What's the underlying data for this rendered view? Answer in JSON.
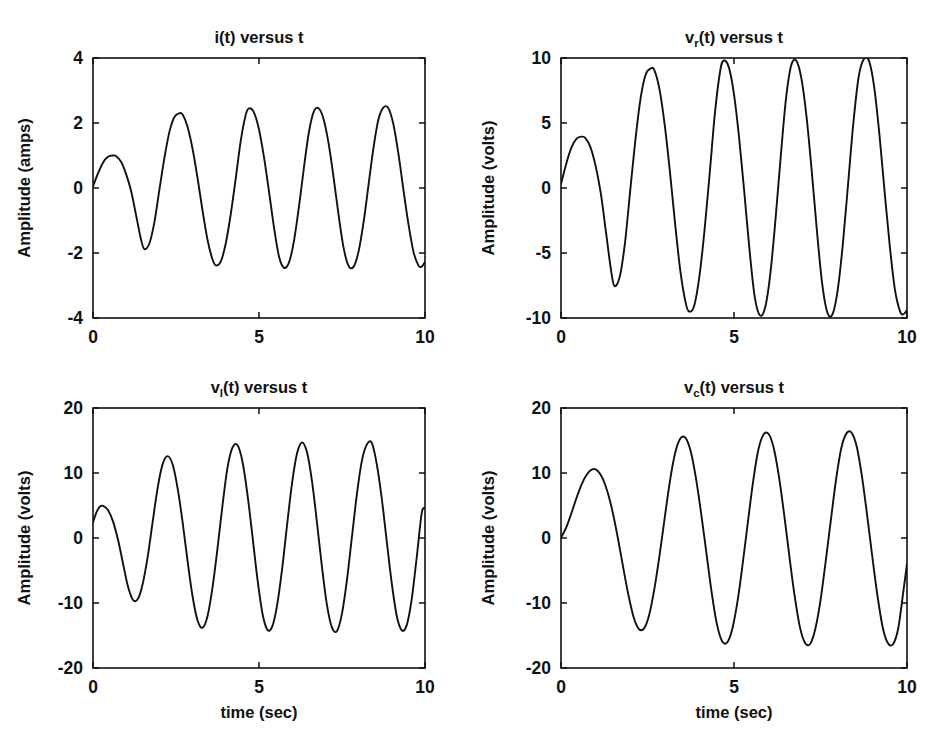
{
  "figure": {
    "background": "#ffffff",
    "line_color": "#111111",
    "width": 937,
    "height": 741,
    "layout": "2x2 subplot grid"
  },
  "chart_data": [
    {
      "id": "current",
      "type": "line",
      "title": "i(t) versus t",
      "title_base": "i",
      "title_sub": "",
      "title_rest": "(t) versus t",
      "xlabel": "",
      "ylabel": "Amplitude (amps)",
      "xlim": [
        0,
        10
      ],
      "ylim": [
        -4,
        4
      ],
      "xticks": [
        0,
        5,
        10
      ],
      "xticklabels": [
        "0",
        "5",
        "10"
      ],
      "yticks": [
        -4,
        -2,
        0,
        2,
        4
      ],
      "yticklabels": [
        "-4",
        "-2",
        "0",
        "2",
        "4"
      ],
      "grid": false,
      "legend": "none",
      "series": [
        {
          "name": "i(t)",
          "x": [
            0.0,
            0.15,
            0.3,
            0.45,
            0.6,
            0.7,
            0.85,
            1.0,
            1.15,
            1.3,
            1.45,
            1.55,
            1.7,
            1.85,
            2.0,
            2.15,
            2.3,
            2.45,
            2.6,
            2.7,
            2.85,
            3.0,
            3.15,
            3.3,
            3.45,
            3.6,
            3.7,
            3.85,
            4.0,
            4.15,
            4.3,
            4.45,
            4.6,
            4.7,
            4.85,
            5.0,
            5.15,
            5.3,
            5.45,
            5.6,
            5.75,
            5.9,
            6.05,
            6.2,
            6.35,
            6.5,
            6.65,
            6.8,
            6.95,
            7.1,
            7.25,
            7.4,
            7.55,
            7.7,
            7.85,
            8.0,
            8.15,
            8.3,
            8.45,
            8.6,
            8.75,
            8.9,
            9.05,
            9.2,
            9.35,
            9.5,
            9.65,
            9.8,
            9.9,
            10.0
          ],
          "y": [
            0.05,
            0.45,
            0.78,
            0.96,
            1.0,
            0.98,
            0.8,
            0.42,
            -0.1,
            -0.85,
            -1.6,
            -1.88,
            -1.7,
            -1.05,
            -0.05,
            0.92,
            1.72,
            2.18,
            2.3,
            2.26,
            1.88,
            1.2,
            0.3,
            -0.7,
            -1.6,
            -2.2,
            -2.38,
            -2.26,
            -1.7,
            -0.8,
            0.3,
            1.45,
            2.25,
            2.45,
            2.32,
            1.8,
            0.95,
            -0.1,
            -1.2,
            -2.1,
            -2.45,
            -2.3,
            -1.65,
            -0.6,
            0.6,
            1.7,
            2.35,
            2.45,
            2.1,
            1.35,
            0.3,
            -0.85,
            -1.85,
            -2.4,
            -2.42,
            -1.95,
            -1.05,
            0.1,
            1.25,
            2.12,
            2.48,
            2.45,
            1.95,
            1.05,
            -0.05,
            -1.1,
            -1.95,
            -2.38,
            -2.42,
            -2.28
          ]
        }
      ]
    },
    {
      "id": "resistor",
      "type": "line",
      "title": "vr(t) versus t",
      "title_base": "v",
      "title_sub": "r",
      "title_rest": "(t) versus t",
      "xlabel": "",
      "ylabel": "Amplitude (volts)",
      "xlim": [
        0,
        10
      ],
      "ylim": [
        -10,
        10
      ],
      "xticks": [
        0,
        5,
        10
      ],
      "xticklabels": [
        "0",
        "5",
        "10"
      ],
      "yticks": [
        -10,
        -5,
        0,
        5,
        10
      ],
      "yticklabels": [
        "-10",
        "-5",
        "0",
        "5",
        "10"
      ],
      "grid": false,
      "legend": "none",
      "series": [
        {
          "name": "vr(t)",
          "x": [
            0.0,
            0.15,
            0.3,
            0.45,
            0.6,
            0.7,
            0.85,
            1.0,
            1.15,
            1.3,
            1.45,
            1.55,
            1.7,
            1.85,
            2.0,
            2.15,
            2.3,
            2.45,
            2.6,
            2.7,
            2.85,
            3.0,
            3.15,
            3.3,
            3.45,
            3.6,
            3.7,
            3.85,
            4.0,
            4.15,
            4.3,
            4.45,
            4.6,
            4.7,
            4.85,
            5.0,
            5.15,
            5.3,
            5.45,
            5.6,
            5.75,
            5.9,
            6.05,
            6.2,
            6.35,
            6.5,
            6.65,
            6.8,
            6.95,
            7.1,
            7.25,
            7.4,
            7.55,
            7.7,
            7.85,
            8.0,
            8.15,
            8.3,
            8.45,
            8.6,
            8.75,
            8.9,
            9.05,
            9.2,
            9.35,
            9.5,
            9.65,
            9.8,
            9.9,
            10.0
          ],
          "y": [
            0.3,
            1.85,
            3.1,
            3.8,
            3.95,
            3.85,
            3.15,
            1.7,
            -0.4,
            -3.4,
            -6.4,
            -7.55,
            -6.8,
            -4.2,
            -0.2,
            3.7,
            6.9,
            8.75,
            9.2,
            9.05,
            7.55,
            4.8,
            1.2,
            -2.8,
            -6.4,
            -8.8,
            -9.5,
            -9.05,
            -6.8,
            -3.2,
            1.2,
            5.8,
            9.0,
            9.8,
            9.3,
            7.2,
            3.8,
            -0.4,
            -4.8,
            -8.4,
            -9.8,
            -9.2,
            -6.6,
            -2.4,
            2.4,
            6.8,
            9.4,
            9.8,
            8.4,
            5.4,
            1.2,
            -3.4,
            -7.4,
            -9.6,
            -9.7,
            -7.8,
            -4.2,
            0.4,
            5.0,
            8.5,
            9.9,
            9.8,
            7.8,
            4.2,
            -0.2,
            -4.4,
            -7.8,
            -9.5,
            -9.7,
            -9.4
          ]
        }
      ]
    },
    {
      "id": "inductor",
      "type": "line",
      "title": "vl(t) versus t",
      "title_base": "v",
      "title_sub": "l",
      "title_rest": "(t) versus t",
      "xlabel": "time (sec)",
      "ylabel": "Amplitude (volts)",
      "xlim": [
        0,
        10
      ],
      "ylim": [
        -20,
        20
      ],
      "xticks": [
        0,
        5,
        10
      ],
      "xticklabels": [
        "0",
        "5",
        "10"
      ],
      "yticks": [
        -20,
        -10,
        0,
        10,
        20
      ],
      "yticklabels": [
        "-20",
        "-10",
        "0",
        "10",
        "20"
      ],
      "grid": false,
      "legend": "none",
      "series": [
        {
          "name": "vl(t)",
          "x": [
            0.0,
            0.1,
            0.2,
            0.3,
            0.45,
            0.6,
            0.75,
            0.9,
            1.05,
            1.2,
            1.35,
            1.5,
            1.65,
            1.8,
            1.95,
            2.1,
            2.25,
            2.4,
            2.55,
            2.7,
            2.85,
            3.0,
            3.15,
            3.3,
            3.45,
            3.6,
            3.75,
            3.9,
            4.05,
            4.2,
            4.35,
            4.5,
            4.65,
            4.8,
            4.95,
            5.1,
            5.25,
            5.4,
            5.55,
            5.7,
            5.85,
            6.0,
            6.15,
            6.3,
            6.45,
            6.6,
            6.75,
            6.9,
            7.05,
            7.2,
            7.35,
            7.5,
            7.65,
            7.8,
            7.95,
            8.1,
            8.25,
            8.4,
            8.55,
            8.7,
            8.85,
            9.0,
            9.15,
            9.3,
            9.45,
            9.6,
            9.75,
            9.9,
            10.0
          ],
          "y": [
            2.4,
            3.9,
            4.8,
            4.95,
            4.3,
            2.6,
            -0.2,
            -3.8,
            -7.4,
            -9.5,
            -9.4,
            -7.0,
            -2.8,
            2.6,
            7.8,
            11.4,
            12.6,
            11.3,
            7.6,
            2.4,
            -3.6,
            -9.0,
            -12.7,
            -13.8,
            -12.0,
            -7.6,
            -1.6,
            5.0,
            10.8,
            13.9,
            14.3,
            11.8,
            6.8,
            0.4,
            -6.2,
            -11.5,
            -14.1,
            -13.6,
            -10.2,
            -4.6,
            2.2,
            8.6,
            13.1,
            14.7,
            13.1,
            8.6,
            2.2,
            -4.6,
            -10.4,
            -13.8,
            -14.3,
            -11.6,
            -6.4,
            0.2,
            6.8,
            11.9,
            14.4,
            14.6,
            11.3,
            6.0,
            -0.6,
            -7.0,
            -12.0,
            -14.2,
            -13.4,
            -9.4,
            -3.0,
            3.8,
            4.6
          ]
        }
      ]
    },
    {
      "id": "capacitor",
      "type": "line",
      "title": "vc(t) versus t",
      "title_base": "v",
      "title_sub": "c",
      "title_rest": "(t) versus t",
      "xlabel": "time (sec)",
      "ylabel": "Amplitude (volts)",
      "xlim": [
        0,
        10
      ],
      "ylim": [
        -20,
        20
      ],
      "xticks": [
        0,
        5,
        10
      ],
      "xticklabels": [
        "0",
        "5",
        "10"
      ],
      "yticks": [
        -20,
        -10,
        0,
        10,
        20
      ],
      "yticklabels": [
        "-20",
        "-10",
        "0",
        "10",
        "20"
      ],
      "grid": false,
      "legend": "none",
      "series": [
        {
          "name": "vc(t)",
          "x": [
            0.0,
            0.15,
            0.3,
            0.45,
            0.6,
            0.75,
            0.9,
            1.05,
            1.2,
            1.35,
            1.5,
            1.65,
            1.8,
            1.95,
            2.1,
            2.25,
            2.4,
            2.55,
            2.7,
            2.85,
            3.0,
            3.15,
            3.3,
            3.45,
            3.6,
            3.75,
            3.9,
            4.05,
            4.2,
            4.35,
            4.5,
            4.65,
            4.8,
            4.95,
            5.1,
            5.25,
            5.4,
            5.55,
            5.7,
            5.85,
            6.0,
            6.15,
            6.3,
            6.45,
            6.6,
            6.75,
            6.9,
            7.05,
            7.2,
            7.35,
            7.5,
            7.65,
            7.8,
            7.95,
            8.1,
            8.25,
            8.4,
            8.55,
            8.7,
            8.85,
            9.0,
            9.15,
            9.3,
            9.45,
            9.6,
            9.75,
            9.9,
            10.0
          ],
          "y": [
            0.05,
            1.6,
            3.8,
            6.2,
            8.3,
            9.8,
            10.55,
            10.4,
            9.2,
            7.0,
            3.8,
            -0.2,
            -4.6,
            -8.8,
            -12.2,
            -14.0,
            -13.9,
            -11.8,
            -7.8,
            -2.6,
            3.2,
            8.8,
            13.1,
            15.3,
            15.4,
            13.3,
            9.2,
            3.8,
            -2.2,
            -8.2,
            -13.1,
            -15.8,
            -16.1,
            -14.0,
            -9.8,
            -4.0,
            2.4,
            8.6,
            13.5,
            15.9,
            16.0,
            13.8,
            9.4,
            3.6,
            -2.8,
            -8.8,
            -13.6,
            -16.1,
            -16.3,
            -14.0,
            -9.6,
            -3.6,
            2.8,
            9.0,
            13.8,
            16.1,
            16.2,
            14.0,
            9.4,
            3.4,
            -3.0,
            -9.0,
            -13.8,
            -16.2,
            -16.3,
            -13.8,
            -8.0,
            -4.0
          ]
        }
      ]
    }
  ]
}
